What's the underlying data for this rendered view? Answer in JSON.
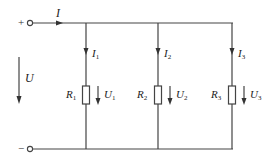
{
  "diagram": {
    "type": "parallel-resistor-circuit",
    "terminals": {
      "positive_sign": "+",
      "negative_sign": "−"
    },
    "source_voltage": {
      "symbol": "U"
    },
    "total_current": {
      "symbol": "I"
    },
    "branches": [
      {
        "resistor": "R",
        "resistor_sub": "1",
        "current": "I",
        "current_sub": "1",
        "voltage": "U",
        "voltage_sub": "1"
      },
      {
        "resistor": "R",
        "resistor_sub": "2",
        "current": "I",
        "current_sub": "2",
        "voltage": "U",
        "voltage_sub": "2"
      },
      {
        "resistor": "R",
        "resistor_sub": "3",
        "current": "I",
        "current_sub": "3",
        "voltage": "U",
        "voltage_sub": "3"
      }
    ],
    "colors": {
      "wire": "#444444",
      "text": "#222222",
      "background": "#ffffff"
    }
  }
}
